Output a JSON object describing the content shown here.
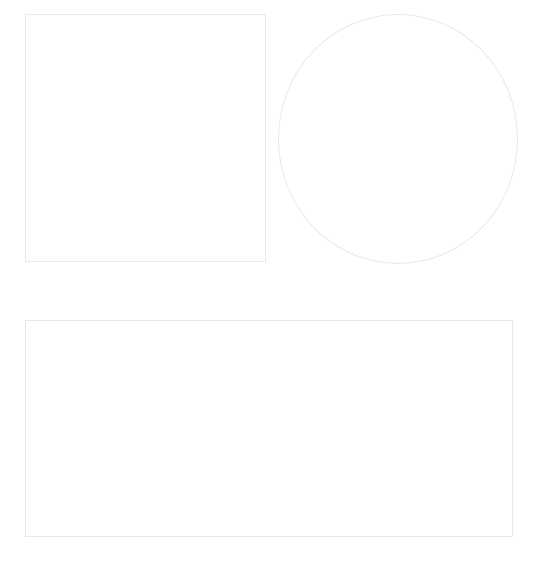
{
  "canvas": {
    "width": 541,
    "height": 571,
    "background_color": "#ffffff",
    "stroke_color": "#e9e9e9",
    "stroke_width": 1,
    "fill": "none"
  },
  "shapes": [
    {
      "id": "square",
      "name": "square",
      "type": "rectangle",
      "label": "Square",
      "x": 25,
      "y": 14,
      "width": 241,
      "height": 248,
      "stroke_color": "#e9e9e9",
      "fill": "none"
    },
    {
      "id": "circle",
      "name": "circle",
      "type": "ellipse",
      "label": "Circle",
      "x": 278,
      "y": 14,
      "width": 240,
      "height": 250,
      "stroke_color": "#e9e9e9",
      "fill": "none"
    },
    {
      "id": "rectangle",
      "name": "rectangle",
      "type": "rectangle",
      "label": "Rectangle",
      "x": 25,
      "y": 320,
      "width": 488,
      "height": 217,
      "stroke_color": "#e9e9e9",
      "fill": "none"
    }
  ]
}
